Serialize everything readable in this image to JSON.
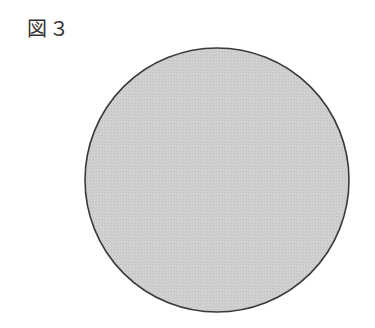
{
  "figure": {
    "label": "図３",
    "shape": "circle",
    "circle": {
      "cx": 217,
      "cy": 180,
      "r": 132,
      "fill": "#cdcdcd",
      "stroke": "#3a3a3a",
      "stroke_width": 1.6
    }
  }
}
